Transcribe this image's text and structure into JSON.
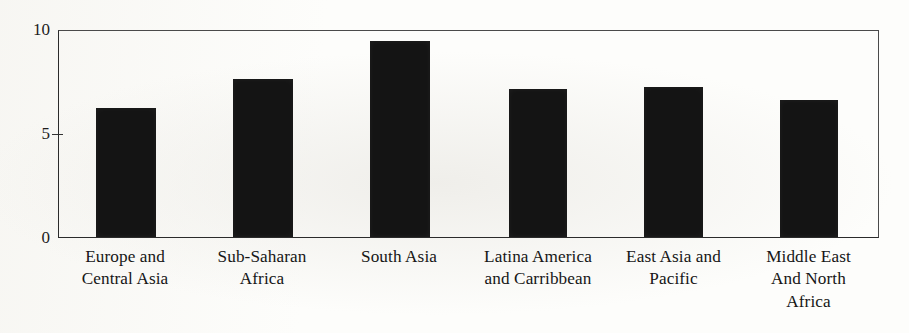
{
  "chart_data": {
    "type": "bar",
    "title": "",
    "xlabel": "",
    "ylabel": "",
    "ylim": [
      0,
      10
    ],
    "yticks": [
      "0",
      "5",
      "10"
    ],
    "ytick_values": [
      0,
      5,
      10
    ],
    "grid": false,
    "legend": "none",
    "bar_color": "#141414",
    "axis_color": "#2b2b2b",
    "categories": [
      "Europe and Central Asia",
      "Sub-Saharan Africa",
      "South Asia",
      "Latina America and Carribbean",
      "East Asia and Pacific",
      "Middle East And North Africa"
    ],
    "category_lines": [
      [
        "Europe and",
        "Central Asia"
      ],
      [
        "Sub-Saharan",
        "Africa"
      ],
      [
        "South Asia"
      ],
      [
        "Latina America",
        "and Carribbean"
      ],
      [
        "East Asia and",
        "Pacific"
      ],
      [
        "Middle East",
        "And North",
        "Africa"
      ]
    ],
    "values": [
      6.2,
      7.6,
      9.4,
      7.1,
      7.2,
      6.6
    ]
  }
}
